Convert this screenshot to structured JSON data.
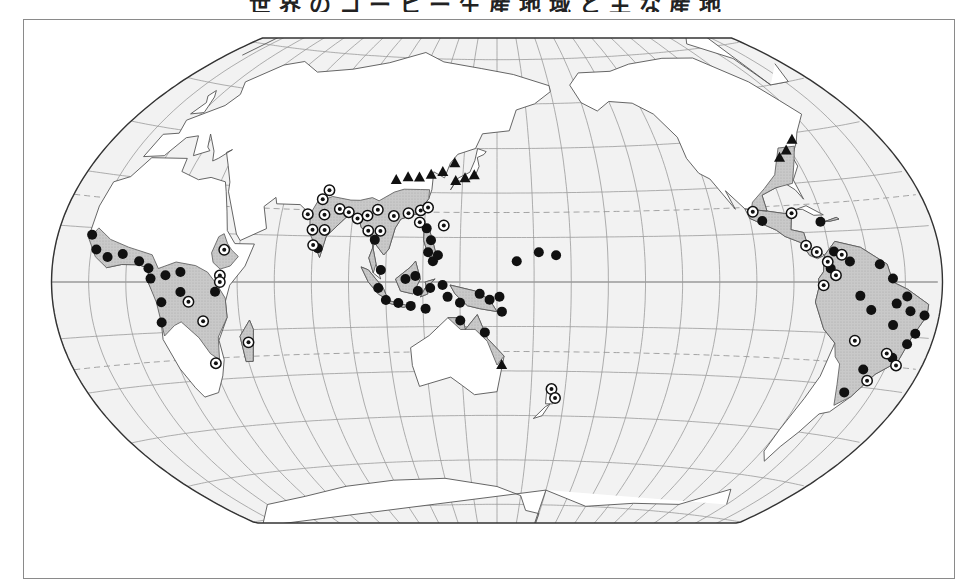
{
  "figure": {
    "title": "世界のコーヒー生産地域と主な産地",
    "legend": {
      "filled_circle": "marker-type-a",
      "ringed_circle": "marker-type-b",
      "triangle": "marker-type-c"
    }
  },
  "colors": {
    "ocean": "#f2f2f2",
    "land": "#ffffff",
    "region": "#c8c8c8",
    "outline": "#333333",
    "graticule": "#9a9a9a",
    "marker": "#111111"
  },
  "map": {
    "projection": "winkel-tripel",
    "center_longitude": 150,
    "tropics_dashed": true,
    "markers": {
      "filled": [
        [
          -16,
          13
        ],
        [
          -13,
          9
        ],
        [
          -8,
          7
        ],
        [
          -2,
          8
        ],
        [
          5,
          6
        ],
        [
          9,
          4
        ],
        [
          10,
          1
        ],
        [
          16,
          2
        ],
        [
          22,
          3
        ],
        [
          22,
          -3
        ],
        [
          36,
          -3
        ],
        [
          14,
          -6
        ],
        [
          13,
          -12
        ],
        [
          77,
          11
        ],
        [
          100,
          14
        ],
        [
          103,
          4
        ],
        [
          102,
          -2
        ],
        [
          105,
          -6
        ],
        [
          110,
          -7
        ],
        [
          115,
          -8
        ],
        [
          118,
          -3
        ],
        [
          123,
          -2
        ],
        [
          124,
          7
        ],
        [
          126,
          9
        ],
        [
          122,
          10
        ],
        [
          123,
          14
        ],
        [
          121,
          18
        ],
        [
          113,
          1
        ],
        [
          117,
          2
        ],
        [
          128,
          -1
        ],
        [
          130,
          -5
        ],
        [
          121,
          -9
        ],
        [
          135,
          -7
        ],
        [
          143,
          -4
        ],
        [
          147,
          -6
        ],
        [
          151,
          -5
        ],
        [
          152,
          -10
        ],
        [
          135,
          -13
        ],
        [
          145,
          -17
        ],
        [
          158,
          7
        ],
        [
          167,
          10
        ],
        [
          174,
          9
        ],
        [
          -100,
          19
        ],
        [
          -76,
          18
        ],
        [
          -73,
          9
        ],
        [
          -75,
          4
        ],
        [
          -67,
          6
        ],
        [
          -55,
          5
        ],
        [
          -50,
          1
        ],
        [
          -63,
          -4
        ],
        [
          -58,
          -8
        ],
        [
          -48,
          -6
        ],
        [
          -44,
          -4
        ],
        [
          -42,
          -8
        ],
        [
          -48,
          -12
        ],
        [
          -36,
          -9
        ],
        [
          -38,
          -14
        ],
        [
          -40,
          -17
        ],
        [
          -44,
          -21
        ],
        [
          -54,
          -25
        ],
        [
          -57,
          -32
        ]
      ],
      "ringed": [
        [
          39,
          10
        ],
        [
          38,
          2
        ],
        [
          38,
          0
        ],
        [
          25,
          -6
        ],
        [
          30,
          -12
        ],
        [
          31,
          -25
        ],
        [
          47,
          -19
        ],
        [
          78,
          30
        ],
        [
          76,
          27
        ],
        [
          71,
          22
        ],
        [
          78,
          22
        ],
        [
          84,
          24
        ],
        [
          74,
          17
        ],
        [
          79,
          17
        ],
        [
          75,
          12
        ],
        [
          88,
          23
        ],
        [
          92,
          21
        ],
        [
          96,
          22
        ],
        [
          100,
          24
        ],
        [
          97,
          17
        ],
        [
          102,
          17
        ],
        [
          107,
          22
        ],
        [
          113,
          23
        ],
        [
          118,
          24
        ],
        [
          121,
          25
        ],
        [
          118,
          20
        ],
        [
          128,
          19
        ],
        [
          174,
          -36
        ],
        [
          176,
          -39
        ],
        [
          -103,
          22
        ],
        [
          -87,
          21
        ],
        [
          -84,
          11
        ],
        [
          -80,
          9
        ],
        [
          -76,
          6
        ],
        [
          -70,
          8
        ],
        [
          -73,
          2
        ],
        [
          -78,
          -1
        ],
        [
          -47,
          -20
        ],
        [
          -62,
          -17
        ],
        [
          -41,
          -23
        ],
        [
          -50,
          -28
        ]
      ],
      "triangles": [
        [
          106,
          34
        ],
        [
          111,
          35
        ],
        [
          116,
          35
        ],
        [
          121,
          36
        ],
        [
          126,
          37
        ],
        [
          131,
          40
        ],
        [
          132,
          34
        ],
        [
          136,
          35
        ],
        [
          140,
          36
        ],
        [
          152,
          -28
        ],
        [
          -82,
          38
        ],
        [
          -77,
          40
        ],
        [
          -71,
          43
        ]
      ]
    }
  }
}
